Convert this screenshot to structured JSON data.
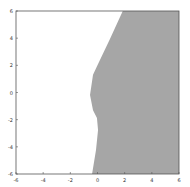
{
  "chart_data": {
    "type": "area",
    "title": "",
    "xlabel": "",
    "ylabel": "",
    "xlim": [
      -6,
      6
    ],
    "ylim": [
      -6,
      6
    ],
    "grid": false,
    "x_ticks": [
      "-6",
      "-4",
      "-2",
      "0",
      "2",
      "4",
      "6"
    ],
    "y_ticks": [
      "6",
      "4",
      "2",
      "0",
      "-2",
      "-4",
      "-6"
    ],
    "fill_color": "#a6a6a6",
    "region_description": "Shaded region to the right of a curved decision boundary",
    "boundary": [
      {
        "x": 1.86,
        "y": 6.0
      },
      {
        "x": 0.9,
        "y": 3.9
      },
      {
        "x": 0.18,
        "y": 2.4
      },
      {
        "x": -0.33,
        "y": 1.3
      },
      {
        "x": -0.55,
        "y": -0.18
      },
      {
        "x": -0.33,
        "y": -1.3
      },
      {
        "x": -0.04,
        "y": -1.87
      },
      {
        "x": 0.04,
        "y": -2.76
      },
      {
        "x": -0.11,
        "y": -4.23
      },
      {
        "x": -0.4,
        "y": -6.0
      }
    ]
  }
}
